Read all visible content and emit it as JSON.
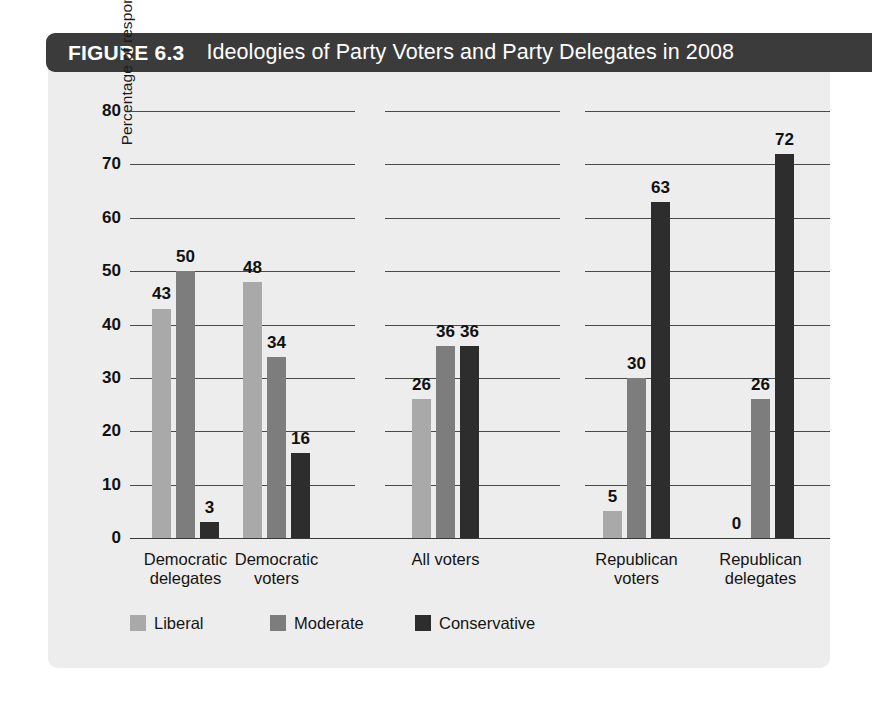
{
  "figure": {
    "number_label": "FIGURE 6.3",
    "title": "Ideologies of Party Voters and Party Delegates in 2008"
  },
  "colors": {
    "panel_background": "#ededed",
    "title_bar": "#3b3b3b",
    "liberal": "#a9a9a9",
    "moderate": "#7d7d7d",
    "conservative": "#2d2d2d",
    "gridline": "#4a4a4a",
    "text": "#111111"
  },
  "chart_data": {
    "type": "bar",
    "title": "Ideologies of Party Voters and Party Delegates in 2008",
    "xlabel": "",
    "ylabel": "Percentage of respondents",
    "ylim": [
      0,
      80
    ],
    "yticks": [
      0,
      10,
      20,
      30,
      40,
      50,
      60,
      70,
      80
    ],
    "ytick_labels": [
      "0",
      "10",
      "20",
      "30",
      "40",
      "50",
      "60",
      "70",
      "80"
    ],
    "grid": true,
    "grid_axis": "y",
    "legend_position": "bottom-left",
    "categories": [
      "Democratic delegates",
      "Democratic voters",
      "All voters",
      "Republican voters",
      "Republican delegates"
    ],
    "category_lines": [
      [
        "Democratic",
        "delegates"
      ],
      [
        "Democratic",
        "voters"
      ],
      [
        "All voters"
      ],
      [
        "Republican",
        "voters"
      ],
      [
        "Republican",
        "delegates"
      ]
    ],
    "series": [
      {
        "name": "Liberal",
        "color": "#a9a9a9",
        "values": [
          43,
          48,
          26,
          5,
          0
        ]
      },
      {
        "name": "Moderate",
        "color": "#7d7d7d",
        "values": [
          50,
          34,
          36,
          30,
          26
        ]
      },
      {
        "name": "Conservative",
        "color": "#2d2d2d",
        "values": [
          3,
          16,
          36,
          63,
          72
        ]
      }
    ],
    "data_labels": [
      [
        "43",
        "50",
        "3"
      ],
      [
        "48",
        "34",
        "16"
      ],
      [
        "26",
        "36",
        "36"
      ],
      [
        "5",
        "30",
        "63"
      ],
      [
        "0",
        "26",
        "72"
      ]
    ]
  },
  "legend": {
    "items": [
      {
        "label": "Liberal",
        "swatch": "liberal"
      },
      {
        "label": "Moderate",
        "swatch": "moderate"
      },
      {
        "label": "Conservative",
        "swatch": "conservative"
      }
    ]
  }
}
